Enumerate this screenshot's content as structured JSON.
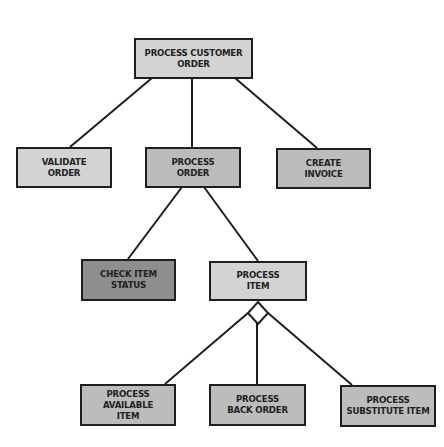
{
  "diagram": {
    "type": "hierarchy",
    "nodes": {
      "root": {
        "label": "PROCESS CUSTOMER\nORDER"
      },
      "validate": {
        "label": "VALIDATE\nORDER"
      },
      "process_order": {
        "label": "PROCESS\nORDER"
      },
      "create_invoice": {
        "label": "CREATE\nINVOICE"
      },
      "check_item_status": {
        "label": "CHECK ITEM\nSTATUS"
      },
      "process_item": {
        "label": "PROCESS\nITEM"
      },
      "process_available_item": {
        "label": "PROCESS AVAILABLE\nITEM"
      },
      "process_back_order": {
        "label": "PROCESS\nBACK ORDER"
      },
      "process_substitute_item": {
        "label": "PROCESS\nSUBSTITUTE ITEM"
      }
    },
    "edges": [
      [
        "root",
        "validate"
      ],
      [
        "root",
        "process_order"
      ],
      [
        "root",
        "create_invoice"
      ],
      [
        "process_order",
        "check_item_status"
      ],
      [
        "process_order",
        "process_item"
      ],
      [
        "process_item",
        "process_available_item"
      ],
      [
        "process_item",
        "process_back_order"
      ],
      [
        "process_item",
        "process_substitute_item"
      ]
    ],
    "selection_marker": {
      "attached_to": "process_item",
      "shape": "diamond"
    },
    "colors": {
      "light": "#d3d3d3",
      "mid": "#bcbcbc",
      "dark": "#8e8e8e",
      "border": "#1e1e1e"
    }
  }
}
